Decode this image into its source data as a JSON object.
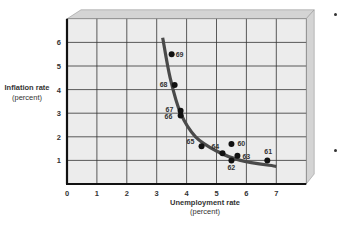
{
  "chart_data": {
    "type": "scatter",
    "title": "",
    "xlabel": "Unemployment rate",
    "xlabel_unit": "(percent)",
    "ylabel": "Inflation rate",
    "ylabel_unit": "(percent)",
    "xlim": [
      0,
      8
    ],
    "ylim": [
      0,
      7
    ],
    "x_ticks": [
      "0",
      "1",
      "2",
      "3",
      "4",
      "5",
      "6",
      "7"
    ],
    "y_ticks": [
      "1",
      "2",
      "3",
      "4",
      "5",
      "6"
    ],
    "grid": true,
    "legend": "none",
    "points": [
      {
        "label": "60",
        "x": 5.5,
        "y": 1.7
      },
      {
        "label": "61",
        "x": 6.7,
        "y": 1.0
      },
      {
        "label": "62",
        "x": 5.5,
        "y": 1.0
      },
      {
        "label": "63",
        "x": 5.7,
        "y": 1.2
      },
      {
        "label": "64",
        "x": 5.2,
        "y": 1.3
      },
      {
        "label": "65",
        "x": 4.5,
        "y": 1.6
      },
      {
        "label": "66",
        "x": 3.8,
        "y": 2.9
      },
      {
        "label": "67",
        "x": 3.8,
        "y": 3.1
      },
      {
        "label": "68",
        "x": 3.6,
        "y": 4.2
      },
      {
        "label": "69",
        "x": 3.5,
        "y": 5.5
      }
    ],
    "curve": {
      "name": "Phillips curve",
      "points": [
        [
          3.2,
          6.2
        ],
        [
          3.45,
          4.5
        ],
        [
          3.8,
          3.0
        ],
        [
          4.3,
          2.0
        ],
        [
          5.0,
          1.4
        ],
        [
          5.8,
          1.0
        ],
        [
          7.0,
          0.75
        ]
      ]
    }
  },
  "labels": {
    "y_title": "Inflation rate",
    "y_unit": "(percent)",
    "x_title": "Unemployment rate",
    "x_unit": "(percent)"
  },
  "colors": {
    "plot_bg": "#ececec",
    "bevel": "#d4d4d4",
    "grid": "#333333",
    "curve": "#4a4a4a",
    "points": "#111111"
  }
}
